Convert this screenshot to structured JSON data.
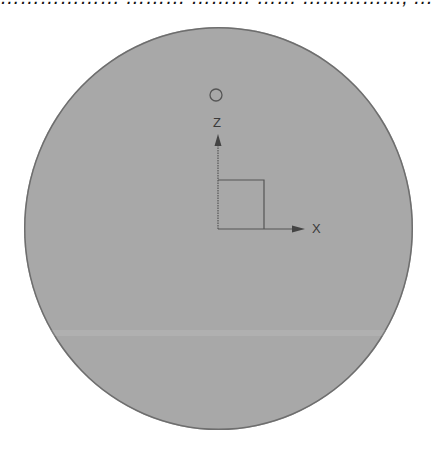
{
  "header": {
    "clipped_text": "……………… ……… ……… …… ……………, ………"
  },
  "viewport": {
    "shape": "circle",
    "fill_color": "#a8a8a8",
    "edge_color": "#6e6e6e"
  },
  "gizmo": {
    "marker_icon": "circle-outline-icon",
    "axes": {
      "vertical_label": "Z",
      "horizontal_label": "X"
    },
    "line_color": "#555555",
    "box_icon": "square-outline-icon"
  }
}
